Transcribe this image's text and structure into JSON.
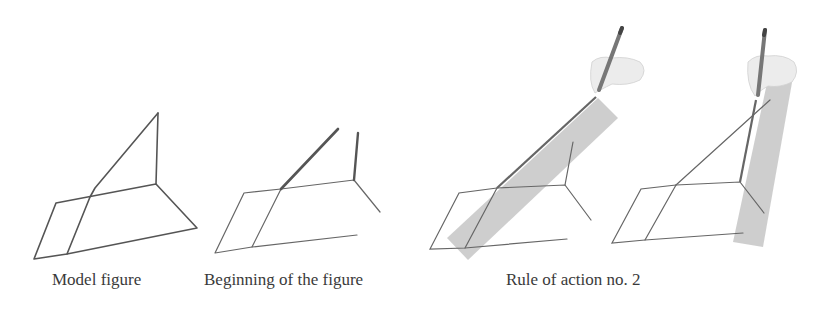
{
  "captions": {
    "model": "Model figure",
    "beginning": "Beginning of the figure",
    "rule": "Rule of action no. 2"
  },
  "colors": {
    "line": "#555555",
    "thick_line": "#5a5a5a",
    "shade": "#c8c8c8",
    "hand": "#e6e6e6",
    "pencil": "#7a7a7a",
    "text": "#3a3a3a"
  },
  "panels": [
    {
      "id": "model-figure",
      "description": "Complete wireframe model figure"
    },
    {
      "id": "beginning-figure",
      "description": "Partially drawn figure with thick started stroke"
    },
    {
      "id": "rule-step-a",
      "description": "Hand with pencil drawing along shaded diagonal band"
    },
    {
      "id": "rule-step-b",
      "description": "Hand with pencil drawing along shaded vertical band"
    }
  ]
}
